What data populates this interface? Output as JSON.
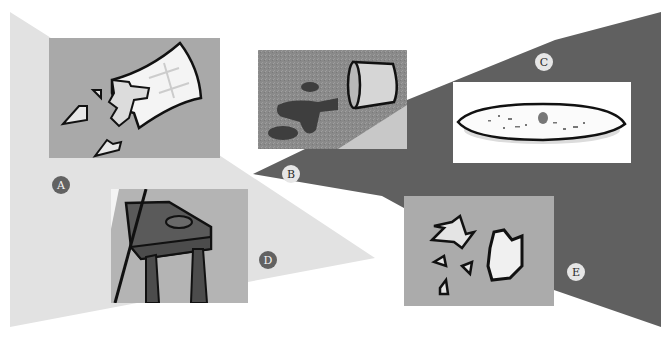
{
  "figure": {
    "colors": {
      "background": "#ffffff",
      "light_region": "#e2e2e2",
      "dark_region": "#606060",
      "panel_gray": "#a9a9a9"
    }
  },
  "panels": [
    {
      "label": "A",
      "content": "shattered glass with fragments"
    },
    {
      "label": "B",
      "content": "tipped-over cup with spilled liquid"
    },
    {
      "label": "C",
      "content": "plate with crumbs"
    },
    {
      "label": "D",
      "content": "table with puddle"
    },
    {
      "label": "E",
      "content": "broken glass pieces on floor"
    }
  ]
}
